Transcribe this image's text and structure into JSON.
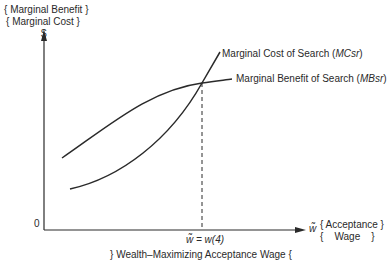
{
  "y_axis": {
    "label_line1": "Marginal Benefit",
    "label_line2": "Marginal Cost",
    "unit": "$",
    "origin": "0"
  },
  "x_axis": {
    "symbol": "w̃",
    "label_line1": "Acceptance",
    "label_line2": "Wage"
  },
  "curves": {
    "mc": {
      "label": "Marginal Cost of Search (",
      "abbr": "MCsr",
      "close": ")"
    },
    "mb": {
      "label": "Marginal Benefit of Search (",
      "abbr": "MBsr",
      "close": ")"
    }
  },
  "intersection": {
    "tick_label": "w̃ = w(4)",
    "caption": "Wealth–Maximizing Acceptance Wage"
  },
  "colors": {
    "ink": "#2a2a2a",
    "background": "#ffffff"
  }
}
